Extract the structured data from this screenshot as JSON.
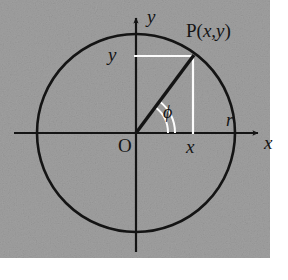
{
  "figure": {
    "background_color": "#a0a0a0",
    "ink_color": "#141414",
    "guide_color": "#fdfdfd",
    "page_color": "#ffffff",
    "plot_area": {
      "x": 0,
      "y": 0,
      "width": 270,
      "height": 258
    },
    "circle": {
      "cx": 136,
      "cy": 133,
      "r": 99
    },
    "origin": {
      "x": 136,
      "y": 133
    },
    "point_P": {
      "x": 193,
      "y": 56
    },
    "angle_phi_degrees": 53,
    "axes": {
      "x_axis": {
        "x1": 14,
        "y1": 133,
        "x2": 262,
        "y2": 133
      },
      "y_axis": {
        "x1": 136,
        "y1": 252,
        "x2": 136,
        "y2": 14
      }
    },
    "guides": {
      "horizontal": {
        "x1": 136,
        "y1": 56,
        "x2": 193,
        "y2": 56
      },
      "vertical": {
        "x1": 193,
        "y1": 56,
        "x2": 193,
        "y2": 133
      }
    }
  },
  "labels": {
    "point_label_prefix": "P",
    "point_label_open": "(",
    "point_label_x": "x",
    "point_label_comma": ",",
    "point_label_y": "y",
    "point_label_close": ")",
    "axis_x": "x",
    "axis_y": "y",
    "coord_x": "x",
    "coord_y": "y",
    "radius": "r",
    "origin": "O",
    "angle": "ϕ"
  }
}
